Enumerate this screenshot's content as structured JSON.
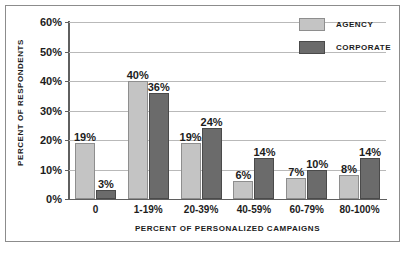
{
  "chart_data": {
    "type": "bar",
    "title": "",
    "xlabel": "PERCENT OF PERSONALIZED CAMPAIGNS",
    "ylabel": "PERCENT OF RESPONDENTS",
    "categories": [
      "0",
      "1-19%",
      "20-39%",
      "40-59%",
      "60-79%",
      "80-100%"
    ],
    "series": [
      {
        "name": "AGENCY",
        "color": "#c4c4c4",
        "values": [
          19,
          40,
          19,
          6,
          7,
          8
        ],
        "labels": [
          "19%",
          "40%",
          "19%",
          "6%",
          "7%",
          "8%"
        ]
      },
      {
        "name": "CORPORATE",
        "color": "#6b6b6b",
        "values": [
          3,
          36,
          24,
          14,
          10,
          14
        ],
        "labels": [
          "3%",
          "36%",
          "24%",
          "14%",
          "10%",
          "14%"
        ]
      }
    ],
    "ylim": [
      0,
      60
    ],
    "ytick_values": [
      0,
      10,
      20,
      30,
      40,
      50,
      60
    ],
    "ytick_labels": [
      "0%",
      "10%",
      "20%",
      "30%",
      "40%",
      "50%",
      "60%"
    ],
    "grid": true,
    "legend_position": "top-right"
  },
  "legend": {
    "items": [
      {
        "label": "AGENCY"
      },
      {
        "label": "CORPORATE"
      }
    ]
  }
}
